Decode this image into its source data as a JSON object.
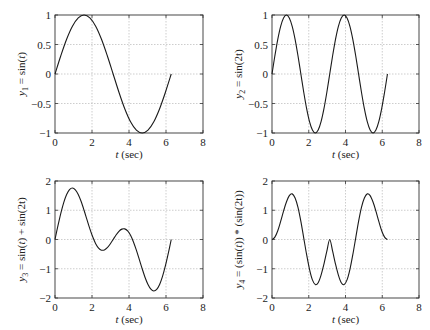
{
  "chart_data": [
    {
      "type": "line",
      "id": "y1",
      "ylabel": "y1 = sin(t)",
      "ylabel_parts": {
        "var": "y",
        "sub": "1",
        "expr": " = sin(",
        "arg": "t",
        "close": ")"
      },
      "xlabel": "t (sec)",
      "xlim": [
        0,
        8
      ],
      "ylim": [
        -1,
        1
      ],
      "xticks": [
        0,
        2,
        4,
        6,
        8
      ],
      "yticks": [
        -1,
        -0.5,
        0,
        0.5,
        1
      ],
      "ytick_labels": [
        "−1",
        "−0.5",
        "0",
        "0.5",
        "1"
      ],
      "grid": true,
      "series": [
        {
          "name": "sin(t)",
          "x": [
            0,
            0.314,
            0.628,
            0.942,
            1.257,
            1.571,
            1.885,
            2.199,
            2.513,
            2.827,
            3.142,
            3.456,
            3.77,
            4.084,
            4.398,
            4.712,
            5.027,
            5.341,
            5.655,
            5.969,
            6.283
          ],
          "y": [
            0,
            0.309,
            0.588,
            0.809,
            0.951,
            1,
            0.951,
            0.809,
            0.588,
            0.309,
            0,
            -0.309,
            -0.588,
            -0.809,
            -0.951,
            -1,
            -0.951,
            -0.809,
            -0.588,
            -0.309,
            0
          ]
        }
      ],
      "box": {
        "left": 55,
        "top": 15,
        "right": 203,
        "bottom": 133
      }
    },
    {
      "type": "line",
      "id": "y2",
      "ylabel": "y2 = sin(2t)",
      "xlabel": "t (sec)",
      "xlim": [
        0,
        8
      ],
      "ylim": [
        -1,
        1
      ],
      "xticks": [
        0,
        2,
        4,
        6,
        8
      ],
      "yticks": [
        -1,
        -0.5,
        0,
        0.5,
        1
      ],
      "ytick_labels": [
        "−1",
        "−0.5",
        "0",
        "0.5",
        "1"
      ],
      "grid": true,
      "series": [
        {
          "name": "sin(2t)",
          "x": [
            0,
            0.157,
            0.314,
            0.471,
            0.628,
            0.785,
            0.942,
            1.1,
            1.257,
            1.414,
            1.571,
            1.728,
            1.885,
            2.042,
            2.199,
            2.356,
            2.513,
            2.67,
            2.827,
            2.985,
            3.142,
            3.299,
            3.456,
            3.613,
            3.77,
            3.927,
            4.084,
            4.241,
            4.398,
            4.555,
            4.712,
            4.869,
            5.027,
            5.184,
            5.341,
            5.498,
            5.655,
            5.812,
            5.969,
            6.126,
            6.283
          ],
          "y": [
            0,
            0.309,
            0.588,
            0.809,
            0.951,
            1,
            0.951,
            0.809,
            0.588,
            0.309,
            0,
            -0.309,
            -0.588,
            -0.809,
            -0.951,
            -1,
            -0.951,
            -0.809,
            -0.588,
            -0.309,
            0,
            0.309,
            0.588,
            0.809,
            0.951,
            1,
            0.951,
            0.809,
            0.588,
            0.309,
            0,
            -0.309,
            -0.588,
            -0.809,
            -0.951,
            -1,
            -0.951,
            -0.809,
            -0.588,
            -0.309,
            0
          ]
        }
      ],
      "box": {
        "left": 272,
        "top": 15,
        "right": 419,
        "bottom": 133
      }
    },
    {
      "type": "line",
      "id": "y3",
      "ylabel": "y3 = sin(t) + sin(2t)",
      "xlabel": "t (sec)",
      "xlim": [
        0,
        8
      ],
      "ylim": [
        -2,
        2
      ],
      "xticks": [
        0,
        2,
        4,
        6,
        8
      ],
      "yticks": [
        -2,
        -1,
        0,
        1,
        2
      ],
      "ytick_labels": [
        "−2",
        "−1",
        "0",
        "1",
        "2"
      ],
      "grid": true,
      "series": [
        {
          "name": "sin(t)+sin(2t)",
          "x": [
            0,
            0.157,
            0.314,
            0.471,
            0.628,
            0.785,
            0.942,
            1.1,
            1.257,
            1.414,
            1.571,
            1.728,
            1.885,
            2.042,
            2.199,
            2.356,
            2.513,
            2.67,
            2.827,
            2.985,
            3.142,
            3.299,
            3.456,
            3.613,
            3.77,
            3.927,
            4.084,
            4.241,
            4.398,
            4.555,
            4.712,
            4.869,
            5.027,
            5.184,
            5.341,
            5.498,
            5.655,
            5.812,
            5.969,
            6.126,
            6.283
          ],
          "y": [
            0,
            0.465,
            0.897,
            1.263,
            1.539,
            1.707,
            1.76,
            1.7,
            1.539,
            1.297,
            1,
            0.679,
            0.363,
            0.083,
            -0.142,
            -0.293,
            -0.364,
            -0.355,
            -0.279,
            -0.153,
            0,
            0.153,
            0.279,
            0.355,
            0.364,
            0.293,
            0.142,
            -0.083,
            -0.363,
            -0.679,
            -1,
            -1.297,
            -1.539,
            -1.7,
            -1.76,
            -1.707,
            -1.539,
            -1.263,
            -0.897,
            -0.465,
            0
          ]
        }
      ],
      "box": {
        "left": 55,
        "top": 181,
        "right": 203,
        "bottom": 298
      }
    },
    {
      "type": "line",
      "id": "y4",
      "ylabel": "y4 = (sin(t)) * (sin(2t))",
      "xlabel": "t (sec)",
      "xlim": [
        0,
        8
      ],
      "ylim": [
        -2,
        2
      ],
      "xticks": [
        0,
        2,
        4,
        6,
        8
      ],
      "yticks": [
        -2,
        -1,
        0,
        1,
        2
      ],
      "ytick_labels": [
        "−2",
        "−1",
        "0",
        "1",
        "2"
      ],
      "grid": true,
      "series": [
        {
          "name": "sin(t)+sin(2t) (as plotted)",
          "x": [
            0,
            0.157,
            0.314,
            0.471,
            0.628,
            0.785,
            0.942,
            1.1,
            1.257,
            1.414,
            1.571,
            1.728,
            1.885,
            2.042,
            2.199,
            2.356,
            2.513,
            2.67,
            2.827,
            2.985,
            3.142,
            3.299,
            3.456,
            3.613,
            3.77,
            3.927,
            4.084,
            4.241,
            4.398,
            4.555,
            4.712,
            4.869,
            5.027,
            5.184,
            5.341,
            5.498,
            5.655,
            5.812,
            5.969,
            6.126,
            6.283
          ],
          "y": [
            0,
            0.08,
            0.3,
            0.62,
            0.97,
            1.28,
            1.5,
            1.56,
            1.42,
            1.1,
            0.62,
            0.05,
            -0.52,
            -1.02,
            -1.38,
            -1.54,
            -1.48,
            -1.22,
            -0.84,
            -0.4,
            0,
            -0.4,
            -0.84,
            -1.22,
            -1.48,
            -1.54,
            -1.38,
            -1.02,
            -0.52,
            0.05,
            0.62,
            1.1,
            1.42,
            1.56,
            1.5,
            1.28,
            0.97,
            0.62,
            0.3,
            0.08,
            0
          ]
        }
      ],
      "box": {
        "left": 272,
        "top": 181,
        "right": 419,
        "bottom": 298
      }
    }
  ]
}
